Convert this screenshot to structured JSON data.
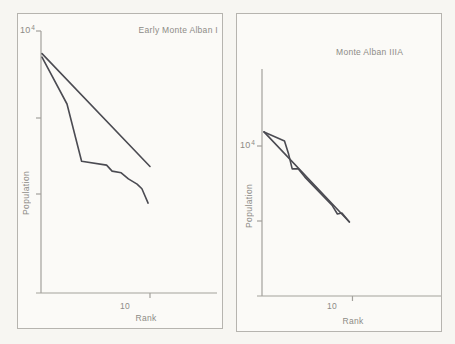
{
  "figure": {
    "background_color": "#f7f6f2",
    "panel_color": "#fbfaf7",
    "border_color": "#b6b4af",
    "axis_color": "#a3a19c",
    "line_color": "#4b4b52",
    "text_color": "#8d8b86"
  },
  "chart_data": [
    {
      "type": "line",
      "title": "Early Monte Alban I",
      "xlabel": "Rank",
      "ylabel": "Population",
      "x_scale": "log",
      "y_scale": "log",
      "xlim": [
        1,
        130
      ],
      "ylim": [
        5,
        10000
      ],
      "grid": false,
      "legend": "none",
      "x_ticks": [
        {
          "value": 10,
          "has_tick": false,
          "label": "10"
        },
        {
          "value": 20,
          "has_tick": true,
          "label": ""
        }
      ],
      "y_ticks": [
        {
          "value": 10000,
          "has_tick": true,
          "label": "10^4",
          "label_base": "10",
          "label_exp": "4"
        },
        {
          "value": 1000,
          "has_tick": true,
          "label": ""
        },
        {
          "value": 100,
          "has_tick": true,
          "label": ""
        }
      ],
      "series": [
        {
          "name": "log-normal expected rank-size line",
          "points": [
            [
              1,
              5500
            ],
            [
              20,
              230
            ]
          ]
        },
        {
          "name": "observed rank-size curve",
          "points": [
            [
              1,
              5000
            ],
            [
              2,
              1450
            ],
            [
              3,
              270
            ],
            [
              6,
              240
            ],
            [
              7,
              200
            ],
            [
              9,
              190
            ],
            [
              11,
              158
            ],
            [
              14,
              135
            ],
            [
              16,
              117
            ],
            [
              19,
              76
            ]
          ]
        }
      ]
    },
    {
      "type": "line",
      "title": "Monte Alban IIIA",
      "xlabel": "Rank",
      "ylabel": "Population",
      "x_scale": "log",
      "y_scale": "log",
      "xlim": [
        1,
        420
      ],
      "ylim": [
        100,
        100000
      ],
      "grid": false,
      "legend": "none",
      "x_ticks": [
        {
          "value": 10,
          "has_tick": false,
          "label": "10"
        },
        {
          "value": 20,
          "has_tick": true,
          "label": ""
        }
      ],
      "y_ticks": [
        {
          "value": 10000,
          "has_tick": true,
          "label": "10^4",
          "label_base": "10",
          "label_exp": "4"
        },
        {
          "value": 1000,
          "has_tick": true,
          "label": ""
        }
      ],
      "series": [
        {
          "name": "log-normal expected rank-size line",
          "points": [
            [
              1,
              15400
            ],
            [
              18,
              970
            ]
          ]
        },
        {
          "name": "observed rank-size curve",
          "points": [
            [
              1,
              15400
            ],
            [
              2,
              11700
            ],
            [
              2.3,
              7800
            ],
            [
              2.6,
              4950
            ],
            [
              3.2,
              4950
            ],
            [
              4,
              3850
            ],
            [
              10,
              1630
            ],
            [
              12,
              1240
            ],
            [
              14,
              1280
            ],
            [
              18,
              970
            ]
          ]
        }
      ]
    }
  ]
}
